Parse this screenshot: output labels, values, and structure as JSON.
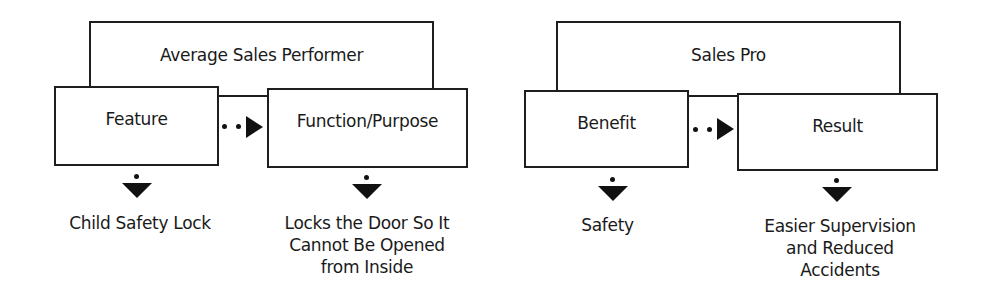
{
  "diagram": {
    "left_group": {
      "header": "Average Sales Performer",
      "first_box": "Feature",
      "second_box": "Function/Purpose",
      "first_result": "Child Safety Lock",
      "second_result": [
        "Locks the Door So It",
        "Cannot Be Opened",
        "from Inside"
      ]
    },
    "right_group": {
      "header": "Sales Pro",
      "first_box": "Benefit",
      "second_box": "Result",
      "first_result": "Safety",
      "second_result": [
        "Easier Supervision",
        "and Reduced",
        "Accidents"
      ]
    },
    "colors": {
      "stroke": "#1e1e1e",
      "fill": "#ffffff",
      "text": "#1a1a1a"
    }
  }
}
